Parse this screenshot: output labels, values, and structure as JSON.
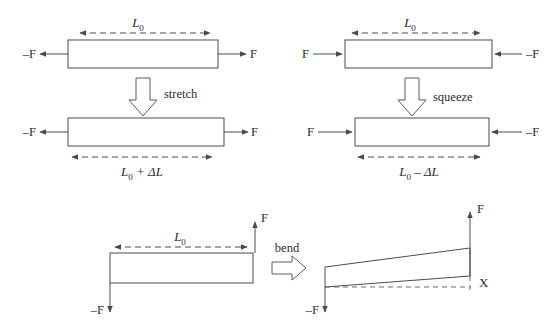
{
  "figure": {
    "background_color": "#ffffff",
    "line_color": "#4a4a4a",
    "text_color": "#2b2b2b"
  },
  "panels": {
    "stretch": {
      "name": "stretch",
      "operation_label": "stretch",
      "before": {
        "length_label_L": "L",
        "length_label_sub": "0",
        "force_left": "–F",
        "force_right": "F"
      },
      "after": {
        "length_label_L": "L",
        "length_label_sub": "0",
        "length_label_rest": "+ ΔL",
        "force_left": "–F",
        "force_right": "F"
      }
    },
    "squeeze": {
      "name": "squeeze",
      "operation_label": "squeeze",
      "before": {
        "length_label_L": "L",
        "length_label_sub": "0",
        "force_left": "F",
        "force_right": "–F"
      },
      "after": {
        "length_label_L": "L",
        "length_label_sub": "0",
        "length_label_rest": "– ΔL",
        "force_left": "F",
        "force_right": "–F"
      }
    },
    "bend": {
      "name": "bend",
      "operation_label": "bend",
      "before": {
        "length_label_L": "L",
        "length_label_sub": "0",
        "force_up": "F",
        "force_down": "–F"
      },
      "after": {
        "force_up": "F",
        "force_down": "–F",
        "deflection_label": "X"
      }
    }
  }
}
